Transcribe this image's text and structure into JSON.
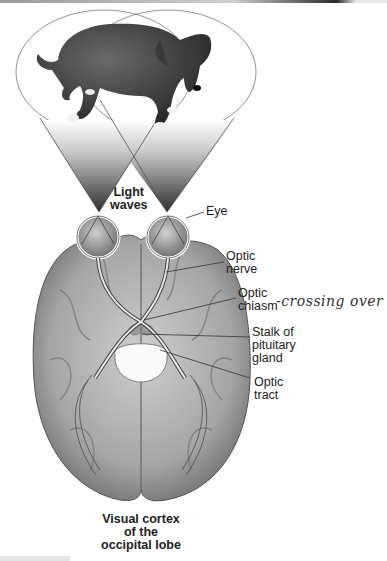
{
  "figure": {
    "labels": {
      "light_waves": [
        "Light",
        "waves"
      ],
      "eye": "Eye",
      "optic_nerve": [
        "Optic",
        "nerve"
      ],
      "optic_chiasm": [
        "Optic",
        "chiasm"
      ],
      "stalk_of_pituitary_gland": [
        "Stalk of",
        "pituitary",
        "gland"
      ],
      "optic_tract": [
        "Optic",
        "tract"
      ],
      "visual_cortex": [
        "Visual cortex",
        "of the",
        "occipital lobe"
      ]
    },
    "annotation": "-crossing over",
    "icons": {
      "dog": "dog-illustration",
      "brain": "brain-inferior-view",
      "eyes": "eyeball-pair"
    },
    "colors": {
      "background": "#ffffff",
      "ink": "#222222",
      "brain_gray": "#8a8a8a",
      "cone_dark": "#3a3a3a"
    }
  }
}
